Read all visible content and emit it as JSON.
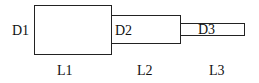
{
  "diagram": {
    "sections": [
      {
        "diameter_label": "D1",
        "length_label": "L1"
      },
      {
        "diameter_label": "D2",
        "length_label": "L2"
      },
      {
        "diameter_label": "D3",
        "length_label": "L3"
      }
    ]
  }
}
